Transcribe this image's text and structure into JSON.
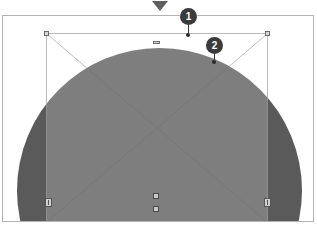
{
  "app": {
    "view_name": "image-editor-canvas",
    "pointer_marker": "down-triangle-marker"
  },
  "canvas": {
    "label": "document-canvas",
    "background_color": "#ffffff",
    "border_color": "#b4b4b4"
  },
  "artwork": {
    "shape": "circle",
    "fill_color": "#5a5a5a",
    "label": "dark-circle-shape"
  },
  "selection": {
    "label": "selection-bounding-box",
    "border_color": "#969696",
    "overlay_color": "rgba(255,255,255,0.22)",
    "handles": [
      {
        "name": "handle-top-left",
        "position": "top-left"
      },
      {
        "name": "handle-top-right",
        "position": "top-right"
      },
      {
        "name": "handle-top-middle",
        "position": "top-middle"
      },
      {
        "name": "handle-left-middle",
        "position": "left-middle"
      },
      {
        "name": "handle-right-middle",
        "position": "right-middle"
      },
      {
        "name": "handle-bottom-middle",
        "position": "bottom-middle"
      },
      {
        "name": "handle-rotate",
        "position": "below-bottom-middle"
      }
    ]
  },
  "annotations": [
    {
      "id": "1",
      "label": "1",
      "target": "top-middle-handle",
      "color": "#3b3b3b"
    },
    {
      "id": "2",
      "label": "2",
      "target": "selection-top-edge",
      "color": "#3b3b3b"
    }
  ]
}
